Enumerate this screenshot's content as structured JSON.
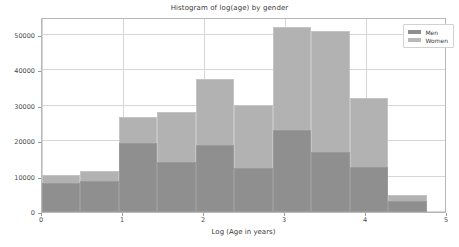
{
  "chart_data": {
    "type": "bar",
    "title": "Histogram of log(age) by gender",
    "xlabel": "Log (Age in years)",
    "ylabel": "",
    "xlim": [
      0,
      5
    ],
    "ylim": [
      0,
      55000
    ],
    "grid": true,
    "legend_position": "upper right",
    "xticks": [
      "0",
      "1",
      "2",
      "3",
      "4",
      "5"
    ],
    "xtick_values": [
      0,
      1,
      2,
      3,
      4,
      5
    ],
    "yticks": [
      "0",
      "10000",
      "20000",
      "30000",
      "40000",
      "50000"
    ],
    "ytick_values": [
      0,
      10000,
      20000,
      30000,
      40000,
      50000
    ],
    "bin_edges": [
      0,
      0.475,
      0.95,
      1.425,
      1.9,
      2.375,
      2.85,
      3.325,
      3.8,
      4.275,
      4.75
    ],
    "bin_centers": [
      0.2375,
      0.7125,
      1.1875,
      1.6625,
      2.1375,
      2.6125,
      3.0875,
      3.5625,
      4.0375,
      4.5125
    ],
    "series": [
      {
        "name": "Women",
        "color": "#b2b2b2",
        "values": [
          10500,
          11600,
          26800,
          28300,
          37500,
          30300,
          52300,
          51000,
          32200,
          4800
        ]
      },
      {
        "name": "Men",
        "color": "#8f8f8f",
        "values": [
          8200,
          8800,
          19400,
          14000,
          19000,
          12300,
          23200,
          16800,
          12800,
          3000
        ]
      }
    ]
  },
  "legend": {
    "entries": [
      {
        "label": "Men",
        "swatch": "legend-swatch-men"
      },
      {
        "label": "Women",
        "swatch": "legend-swatch-women"
      }
    ]
  }
}
